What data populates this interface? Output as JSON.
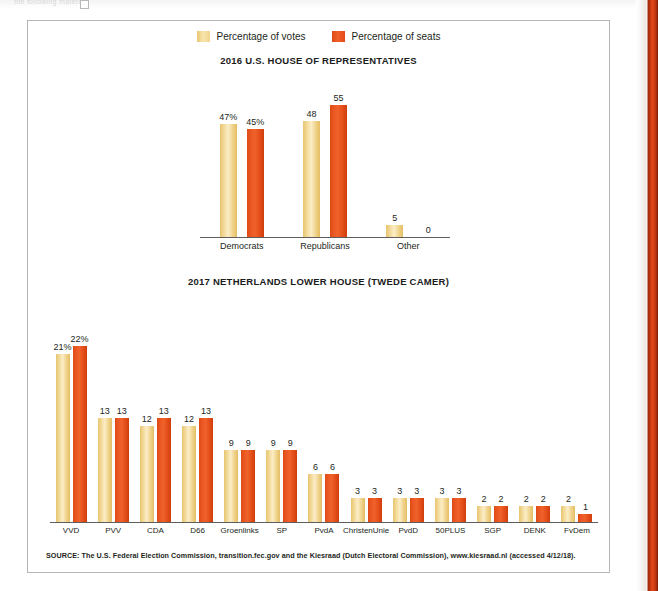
{
  "page": {
    "ghost_header": "the following material",
    "edge_band_color": "#c2360f"
  },
  "legend": {
    "items": [
      {
        "label": "Percentage of votes",
        "color": "#f0d48d",
        "key": "votes"
      },
      {
        "label": "Percentage of seats",
        "color": "#e8491b",
        "key": "seats"
      }
    ]
  },
  "charts": [
    {
      "id": "us-house-2016",
      "title": "2016 U.S. HOUSE OF REPRESENTATIVES"
    },
    {
      "id": "netherlands-2017",
      "title": "2017 NETHERLANDS LOWER HOUSE (TWEDE CAMER)"
    }
  ],
  "source": {
    "text": "SOURCE: The U.S. Federal Election Commission, transition.fec.gov and the Kiesraad (Dutch Electoral Commission), www.kiesraad.nl (accessed 4/12/18)."
  },
  "chart_data": [
    {
      "type": "bar",
      "id": "us-house-2016",
      "title": "2016 U.S. HOUSE OF REPRESENTATIVES",
      "xlabel": "",
      "ylabel": "",
      "ylim": [
        0,
        60
      ],
      "grid": false,
      "legend_position": "top-center",
      "categories": [
        "Democrats",
        "Republicans",
        "Other"
      ],
      "series": [
        {
          "name": "Percentage of votes",
          "color": "#f0d48d",
          "values": [
            47,
            48,
            5
          ],
          "labels": [
            "47%",
            "48",
            "5"
          ]
        },
        {
          "name": "Percentage of seats",
          "color": "#e8491b",
          "values": [
            45,
            55,
            0
          ],
          "labels": [
            "45%",
            "55",
            "0"
          ]
        }
      ]
    },
    {
      "type": "bar",
      "id": "netherlands-2017",
      "title": "2017 NETHERLANDS LOWER HOUSE (TWEDE CAMER)",
      "xlabel": "",
      "ylabel": "",
      "ylim": [
        0,
        24
      ],
      "grid": false,
      "legend_position": "top-center",
      "categories": [
        "VVD",
        "PVV",
        "CDA",
        "D66",
        "Groenlinks",
        "SP",
        "PvdA",
        "ChristenUnie",
        "PvdD",
        "50PLUS",
        "SGP",
        "DENK",
        "FvDem"
      ],
      "series": [
        {
          "name": "Percentage of votes",
          "color": "#f0d48d",
          "values": [
            21,
            13,
            12,
            12,
            9,
            9,
            6,
            3,
            3,
            3,
            2,
            2,
            2
          ],
          "labels": [
            "21%",
            "13",
            "12",
            "12",
            "9",
            "9",
            "6",
            "3",
            "3",
            "3",
            "2",
            "2",
            "2"
          ]
        },
        {
          "name": "Percentage of seats",
          "color": "#e8491b",
          "values": [
            22,
            13,
            13,
            13,
            9,
            9,
            6,
            3,
            3,
            3,
            2,
            2,
            1
          ],
          "labels": [
            "22%",
            "13",
            "13",
            "13",
            "9",
            "9",
            "6",
            "3",
            "3",
            "3",
            "2",
            "2",
            "1"
          ]
        }
      ]
    }
  ]
}
